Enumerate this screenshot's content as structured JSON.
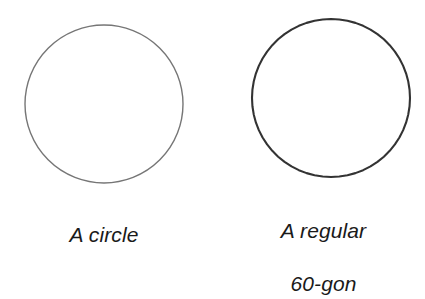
{
  "figure": {
    "background_color": "#ffffff",
    "width": 425,
    "height": 276,
    "shapes": [
      {
        "id": "circle-left",
        "icon": "circle-outline-icon",
        "kind": "circle",
        "center_x": 104,
        "center_y": 104,
        "radius": 79,
        "stroke_color": "#767676",
        "stroke_width": 1.4,
        "fill": "none"
      },
      {
        "id": "polygon-right",
        "icon": "regular-polygon-outline-icon",
        "kind": "regular-polygon",
        "sides": 60,
        "center_x": 331,
        "center_y": 98,
        "radius": 79,
        "stroke_color": "#333333",
        "stroke_width": 2.1,
        "fill": "none"
      }
    ],
    "captions": {
      "left": {
        "lines": [
          "A circle"
        ],
        "text": "A circle",
        "color": "#1a1a1a"
      },
      "right": {
        "lines": [
          "A regular",
          "60-gon"
        ],
        "line1": "A regular",
        "line2": "60-gon",
        "text": "A regular 60-gon",
        "color": "#1a1a1a"
      }
    }
  }
}
